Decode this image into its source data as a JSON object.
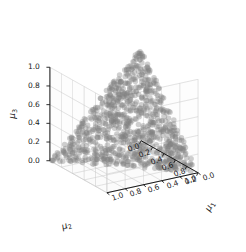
{
  "chart_data": {
    "type": "scatter",
    "projection": "3d",
    "title": "",
    "xlabel": "μ₂",
    "ylabel": "μ₁",
    "zlabel": "μ₃",
    "xlim": [
      0.0,
      1.0
    ],
    "ylim": [
      0.0,
      1.0
    ],
    "zlim": [
      0.0,
      1.0
    ],
    "xticks": [
      "0.0",
      "0.2",
      "0.4",
      "0.6",
      "0.8",
      "1.0"
    ],
    "yticks": [
      "0.0",
      "0.2",
      "0.4",
      "0.6",
      "0.8",
      "1.0"
    ],
    "zticks": [
      "0.0",
      "0.2",
      "0.4",
      "0.6",
      "0.8",
      "1.0"
    ],
    "grid": true,
    "legend": null,
    "n_points": 900,
    "constraint": "μ₁ + μ₂ + μ₃ = 1",
    "marker": {
      "color": "#808080",
      "alpha": 0.38,
      "size": 5.5,
      "shape": "circle"
    },
    "pane_color": "#ffffff",
    "grid_color": "#c8c8c8",
    "axis_color": "#1a1a1a",
    "tick_color": "#1a1a1a",
    "view": {
      "elev": 22,
      "azim": -58
    }
  },
  "axes": {
    "x": {
      "name": "mu2",
      "label_html": "μ<sub>2</sub>",
      "ticks": [
        "0.0",
        "0.2",
        "0.4",
        "0.6",
        "0.8",
        "1.0"
      ]
    },
    "y": {
      "name": "mu1",
      "label_html": "μ<sub>1</sub>",
      "ticks": [
        "0.0",
        "0.2",
        "0.4",
        "0.6",
        "0.8",
        "1.0"
      ]
    },
    "z": {
      "name": "mu3",
      "label_html": "μ<sub>3</sub>",
      "ticks": [
        "0.0",
        "0.2",
        "0.4",
        "0.6",
        "0.8",
        "1.0"
      ]
    }
  }
}
